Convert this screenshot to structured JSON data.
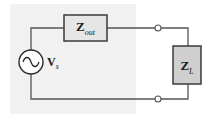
{
  "diagram": {
    "type": "circuit",
    "components": {
      "source": {
        "symbol": "V",
        "subscript": "s",
        "kind": "ac-voltage-source"
      },
      "output_impedance": {
        "symbol": "Z",
        "subscript": "out",
        "kind": "impedance-box"
      },
      "load_impedance": {
        "symbol": "Z",
        "subscript": "L",
        "kind": "impedance-box"
      }
    },
    "terminals": 2,
    "colors": {
      "wire": "#555555",
      "box_border": "#3a3a3a",
      "zout_fill": "#e6e6e6",
      "zl_fill": "#cfcfcf",
      "shade": "#f1f1f1"
    }
  }
}
